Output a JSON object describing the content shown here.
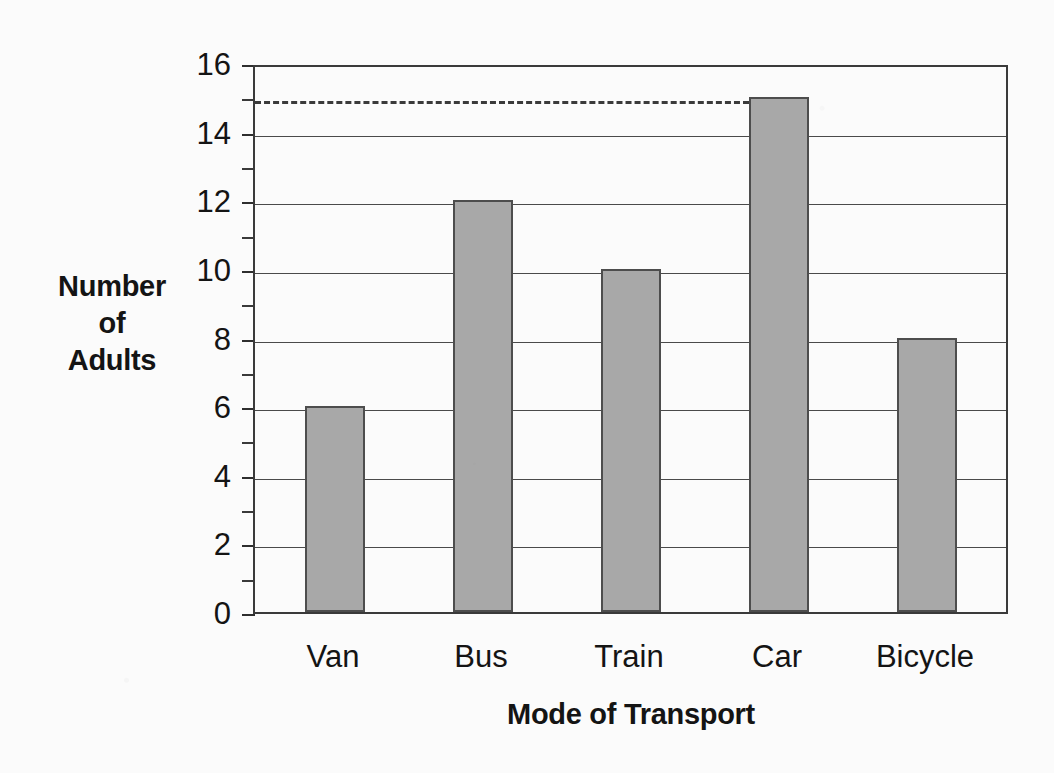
{
  "chart_data": {
    "type": "bar",
    "title": "",
    "xlabel": "Mode of Transport",
    "ylabel": "Number\nof\nAdults",
    "ylabel_lines": [
      "Number",
      "of",
      "Adults"
    ],
    "categories": [
      "Van",
      "Bus",
      "Train",
      "Car",
      "Bicycle"
    ],
    "values": [
      6,
      12,
      10,
      15,
      8
    ],
    "ylim": [
      0,
      16
    ],
    "xlim_note": "categorical",
    "y_major_ticks": [
      0,
      2,
      4,
      6,
      8,
      10,
      12,
      14,
      16
    ],
    "y_major_tick_labels": [
      "0",
      "2",
      "4",
      "6",
      "8",
      "10",
      "12",
      "14",
      "16"
    ],
    "y_minor_ticks": [
      1,
      3,
      5,
      7,
      9,
      11,
      13,
      15
    ],
    "grid": "horizontal major gridlines only",
    "legend": "none",
    "legend_position": "none",
    "annotations": [
      {
        "type": "reference-line",
        "style": "dashed",
        "value": 15,
        "axis": "y",
        "extent": "from y-axis to the Car bar",
        "label": ""
      }
    ],
    "bar_fill_color": "#a8a8a8",
    "bar_edge_color": "#4d4d4d",
    "axis_color": "#3a3a3a",
    "gridline_color": "#4a4a4a",
    "background_color": "#fbfbfb"
  },
  "axes": {
    "y_title_lines": [
      "Number",
      "of",
      "Adults"
    ],
    "x_title": "Mode of Transport"
  }
}
